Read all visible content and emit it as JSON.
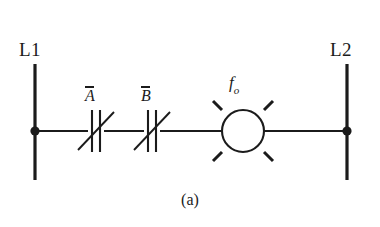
{
  "figure": {
    "caption": "(a)",
    "background_color": "#ffffff",
    "ink_color": "#1b1b1b"
  },
  "rails": {
    "left": {
      "label": "L1",
      "x": 35,
      "y_top": 64,
      "y_bottom": 180
    },
    "right": {
      "label": "L2",
      "x": 347,
      "y_top": 64,
      "y_bottom": 180
    }
  },
  "rung": {
    "y": 131,
    "junction_left": {
      "x": 35,
      "y": 131
    },
    "junction_right": {
      "x": 347,
      "y": 131
    }
  },
  "contacts": [
    {
      "name": "contact-a",
      "label": "A",
      "overbar": true,
      "type": "normally-closed",
      "x": 96,
      "y": 131
    },
    {
      "name": "contact-b",
      "label": "B",
      "overbar": true,
      "type": "normally-closed",
      "x": 152,
      "y": 131
    }
  ],
  "lamp": {
    "name": "output-lamp",
    "label_base": "f",
    "label_sub": "o",
    "center_x": 243,
    "center_y": 131,
    "radius": 21,
    "ray_count": 4
  }
}
